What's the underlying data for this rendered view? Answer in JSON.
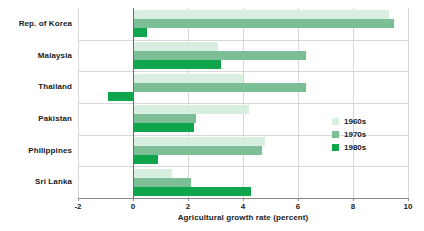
{
  "chart_data": {
    "type": "bar",
    "orientation": "horizontal",
    "title": "",
    "xlabel": "Agricultural growth rate (percent)",
    "ylabel": "",
    "xlim": [
      -2,
      10
    ],
    "xticks": [
      -2,
      0,
      2,
      4,
      6,
      8,
      10
    ],
    "xticklabels": [
      "-2",
      "0",
      "2",
      "4",
      "6",
      "8",
      "10"
    ],
    "grid": true,
    "legend_position": "right",
    "categories": [
      "Rep. of Korea",
      "Malaysia",
      "Thailand",
      "Pakistan",
      "Philippines",
      "Sri Lanka"
    ],
    "series": [
      {
        "name": "1960s",
        "color": "#d8efdf",
        "values": [
          9.3,
          3.1,
          4.0,
          4.2,
          4.8,
          1.4
        ]
      },
      {
        "name": "1970s",
        "color": "#7cbf97",
        "values": [
          9.5,
          6.3,
          6.3,
          2.3,
          4.7,
          2.1
        ]
      },
      {
        "name": "1980s",
        "color": "#0fa64b",
        "values": [
          0.5,
          3.2,
          -0.9,
          2.2,
          0.9,
          4.3
        ]
      }
    ]
  },
  "legend": {
    "items": [
      {
        "label": "1960s",
        "color": "#d8efdf"
      },
      {
        "label": "1970s",
        "color": "#7cbf97"
      },
      {
        "label": "1980s",
        "color": "#0fa64b"
      }
    ]
  },
  "axis": {
    "x_title": "Agricultural growth rate (percent)"
  }
}
